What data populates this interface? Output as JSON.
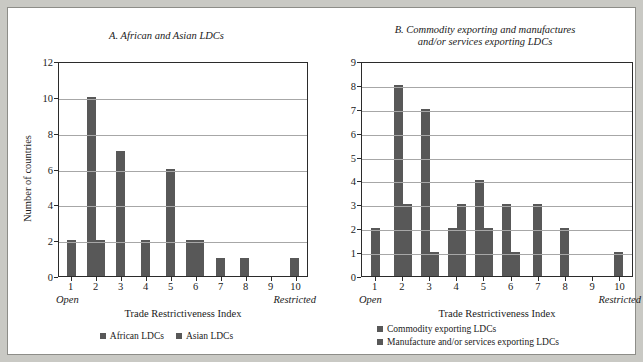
{
  "figure": {
    "background_color": "#c9c9c4",
    "bar_color": "#585858",
    "panel_background": "#ffffff"
  },
  "chart_data": [
    {
      "type": "bar",
      "panel": "A",
      "title": "A. African and Asian LDCs",
      "xlabel": "Trade Restrictiveness Index",
      "ylabel": "Number of countries",
      "xlim_label_left": "Open",
      "xlim_label_right": "Restricted",
      "categories": [
        "1",
        "2",
        "3",
        "4",
        "5",
        "6",
        "7",
        "8",
        "9",
        "10"
      ],
      "yticks": [
        0,
        2,
        4,
        6,
        8,
        10,
        12
      ],
      "ylim": [
        0,
        12
      ],
      "grid": true,
      "legend_position": "bottom-center",
      "series": [
        {
          "name": "African LDCs",
          "color": "#585858",
          "values": [
            2,
            10,
            7,
            2,
            6,
            2,
            1,
            1,
            0,
            1
          ]
        },
        {
          "name": "Asian LDCs",
          "color": "#585858",
          "values": [
            0,
            2,
            0,
            0,
            0,
            2,
            0,
            0,
            0,
            0
          ]
        }
      ]
    },
    {
      "type": "bar",
      "panel": "B",
      "title_line1": "B. Commodity exporting and manufactures",
      "title_line2": "and/or services exporting LDCs",
      "xlabel": "Trade Restrictiveness Index",
      "ylabel": "",
      "xlim_label_left": "Open",
      "xlim_label_right": "Restricted",
      "categories": [
        "1",
        "2",
        "3",
        "4",
        "5",
        "6",
        "7",
        "8",
        "9",
        "10"
      ],
      "yticks": [
        0,
        1,
        2,
        3,
        4,
        5,
        6,
        7,
        8,
        9
      ],
      "ylim": [
        0,
        9
      ],
      "grid": true,
      "legend_position": "bottom-left",
      "series": [
        {
          "name": "Commodity exporting LDCs",
          "color": "#585858",
          "values": [
            2,
            8,
            7,
            2,
            4,
            3,
            3,
            2,
            0,
            1
          ]
        },
        {
          "name": "Manufacture and/or services exporting LDCs",
          "color": "#585858",
          "values": [
            0,
            3,
            1,
            3,
            2,
            1,
            0,
            0,
            0,
            0
          ]
        }
      ]
    }
  ]
}
